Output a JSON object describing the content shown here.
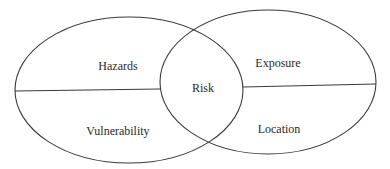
{
  "diagram": {
    "type": "venn",
    "stroke_color": "#3a3a3a",
    "left_circle": {
      "top_label": "Hazards",
      "bottom_label": "Vulnerability"
    },
    "right_circle": {
      "top_label": "Exposure",
      "bottom_label": "Location"
    },
    "intersection_label": "Risk"
  }
}
